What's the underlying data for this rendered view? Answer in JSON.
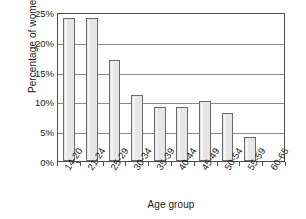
{
  "chart_data": {
    "type": "bar",
    "title": "",
    "xlabel": "Age group",
    "ylabel": "Percentage of women",
    "categories": [
      "14-20",
      "21-24",
      "25-29",
      "30-34",
      "35-39",
      "40-44",
      "45-49",
      "50-54",
      "55-59",
      "60-65"
    ],
    "values": [
      24,
      24,
      17,
      11,
      9,
      9,
      10,
      8,
      4,
      0
    ],
    "ylim": [
      0,
      25
    ],
    "ytick_values": [
      0,
      5,
      10,
      15,
      20,
      25
    ],
    "ytick_labels": [
      "0%",
      "5%",
      "10%",
      "15%",
      "20%",
      "25%"
    ],
    "grid": true,
    "grid_axis": "y",
    "legend": false,
    "bar_fill_color": "#e6e6e6",
    "bar_edge_color": "#6b6b6b",
    "gridline_color": "#8c8c8c",
    "frame_color": "#4d4d4d",
    "text_color": "#1a1a1a"
  }
}
